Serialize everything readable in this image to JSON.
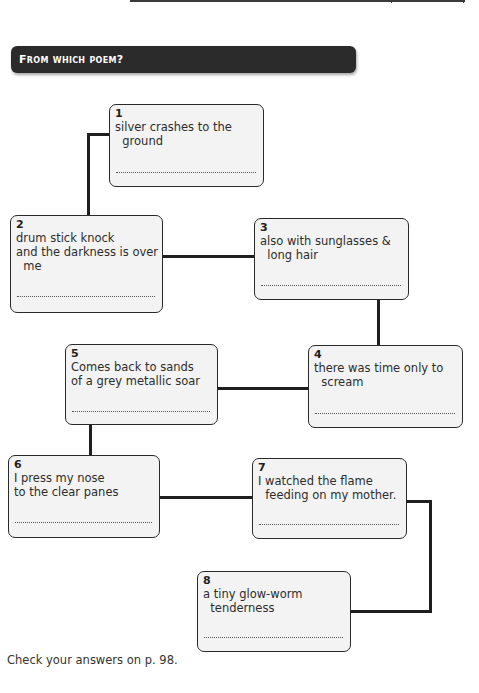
{
  "header": {
    "title": "From which poem?"
  },
  "boxes": [
    {
      "number": "1",
      "text": "silver crashes to the\n  ground",
      "answer": ""
    },
    {
      "number": "2",
      "text": "drum stick knock\nand the darkness is over\n  me",
      "answer": ""
    },
    {
      "number": "3",
      "text": "also with sunglasses &\n  long hair",
      "answer": ""
    },
    {
      "number": "4",
      "text": "there was time only to\n  scream",
      "answer": ""
    },
    {
      "number": "5",
      "text": "Comes back to sands\nof a grey metallic soar",
      "answer": ""
    },
    {
      "number": "6",
      "text": "I press my nose\nto the clear panes",
      "answer": ""
    },
    {
      "number": "7",
      "text": "I watched the flame\n  feeding on my mother.",
      "answer": ""
    },
    {
      "number": "8",
      "text": "a tiny glow-worm\n  tenderness",
      "answer": ""
    }
  ],
  "footer": {
    "note": "Check your answers on p. 98."
  },
  "colors": {
    "banner_bg": "#2b2b2b",
    "box_bg": "#f3f3f3",
    "connector": "#1f1f1f"
  }
}
